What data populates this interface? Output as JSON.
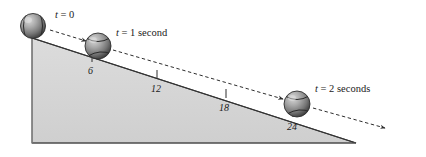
{
  "figure": {
    "background_color": "#ffffff",
    "incline": {
      "fill_color": "#d4d4d4",
      "stroke_color": "#3a3a3a",
      "apex": {
        "x": 32,
        "y": 38
      },
      "bottom_left": {
        "x": 32,
        "y": 143
      },
      "bottom_right": {
        "x": 356,
        "y": 143
      }
    },
    "balls": [
      {
        "id": "ball-t0",
        "label": "t = 0",
        "cx": 33,
        "cy": 26,
        "r": 12.5,
        "color": "#8a8a8a"
      },
      {
        "id": "ball-t1",
        "label": "t = 1 second",
        "cx": 98,
        "cy": 46,
        "r": 13,
        "color": "#8a8a8a"
      },
      {
        "id": "ball-t2",
        "label": "t = 2 seconds",
        "cx": 297,
        "cy": 104,
        "r": 13,
        "color": "#8a8a8a"
      }
    ],
    "time_labels": [
      {
        "id": "time-label-t0",
        "variable": "t",
        "equals": " = ",
        "value": "0",
        "x": 55,
        "y": 18
      },
      {
        "id": "time-label-t1",
        "variable": "t",
        "equals": " = ",
        "value": "1 second",
        "x": 116,
        "y": 36
      },
      {
        "id": "time-label-t2",
        "variable": "t",
        "equals": " = ",
        "value": "2 seconds",
        "x": 315,
        "y": 92
      }
    ],
    "distance_marks": [
      {
        "id": "distance-mark-6",
        "label": "6",
        "tick_x": 92,
        "tick_y": 59,
        "label_x": 88,
        "label_y": 74
      },
      {
        "id": "distance-mark-12",
        "label": "12",
        "tick_x": 157,
        "tick_y": 76,
        "label_x": 151,
        "label_y": 92
      },
      {
        "id": "distance-mark-18",
        "label": "18",
        "tick_x": 226,
        "tick_y": 95,
        "label_x": 219,
        "label_y": 111
      },
      {
        "id": "distance-mark-24",
        "label": "24",
        "tick_x": 293,
        "tick_y": 114,
        "label_x": 287,
        "label_y": 130
      }
    ],
    "motion_arrows": [
      {
        "id": "motion-arrow-1",
        "x1": 50,
        "y1": 30,
        "x2": 86,
        "y2": 41
      },
      {
        "id": "motion-arrow-2",
        "x1": 113,
        "y1": 50,
        "x2": 283,
        "y2": 99
      },
      {
        "id": "motion-arrow-3",
        "x1": 313,
        "y1": 108,
        "x2": 385,
        "y2": 128
      }
    ],
    "colors": {
      "incline_fill": "#d4d4d4",
      "line": "#3a3a3a",
      "ball_light": "#c8c8c8",
      "ball_mid": "#8f8f8f",
      "ball_dark": "#4a4a4a",
      "text": "#1a1a1a"
    }
  }
}
